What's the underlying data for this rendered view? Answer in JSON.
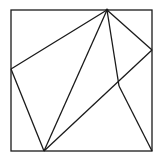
{
  "diagram": {
    "stroke_color": "#1a1a1a",
    "background": "#ffffff",
    "square": {
      "x": 11,
      "y": 10,
      "width": 141,
      "height": 141
    },
    "points": {
      "top": [
        107,
        10
      ],
      "left": [
        11,
        69
      ],
      "right": [
        152,
        50
      ],
      "bottom": [
        44,
        151
      ],
      "interior": [
        119,
        86
      ],
      "bottom_right": [
        152,
        151
      ]
    },
    "segments": [
      {
        "name": "top-to-left",
        "from": "top",
        "to": "left"
      },
      {
        "name": "top-to-right",
        "from": "top",
        "to": "right"
      },
      {
        "name": "top-to-bottom",
        "from": "top",
        "to": "bottom"
      },
      {
        "name": "top-to-interior",
        "from": "top",
        "to": "interior"
      },
      {
        "name": "left-to-bottom",
        "from": "left",
        "to": "bottom"
      },
      {
        "name": "bottom-to-right",
        "from": "bottom",
        "to": "right"
      },
      {
        "name": "interior-to-bottom-right",
        "from": "interior",
        "to": "bottom_right"
      }
    ]
  }
}
